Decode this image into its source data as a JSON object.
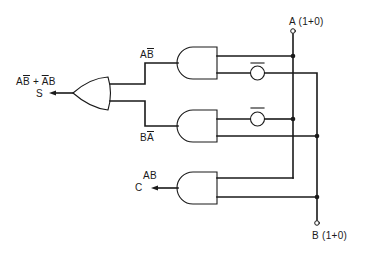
{
  "colors": {
    "ink": "#1a1a1a",
    "background": "#ffffff"
  },
  "inputs": {
    "a": {
      "label": "A (1+0)"
    },
    "b": {
      "label": "B (1+0)"
    }
  },
  "outputs": {
    "sum": {
      "expression_parts": [
        "A",
        "B",
        " + ",
        "A",
        "B"
      ],
      "expression": "AB̄ + ĀB",
      "name": "S"
    },
    "carry": {
      "expression": "AB",
      "name": "C"
    }
  },
  "gates": [
    {
      "id": "and-top",
      "type": "AND",
      "output_label_parts": [
        "A",
        "B"
      ],
      "output_label": "AB̄"
    },
    {
      "id": "and-middle",
      "type": "AND",
      "output_label_parts": [
        "B",
        "A"
      ],
      "output_label": "BĀ"
    },
    {
      "id": "and-bottom",
      "type": "AND",
      "output_label": "AB"
    },
    {
      "id": "or-sum",
      "type": "OR"
    }
  ],
  "inverters": [
    {
      "id": "inv-b",
      "on": "top AND lower input"
    },
    {
      "id": "inv-a",
      "on": "middle AND upper input"
    }
  ]
}
